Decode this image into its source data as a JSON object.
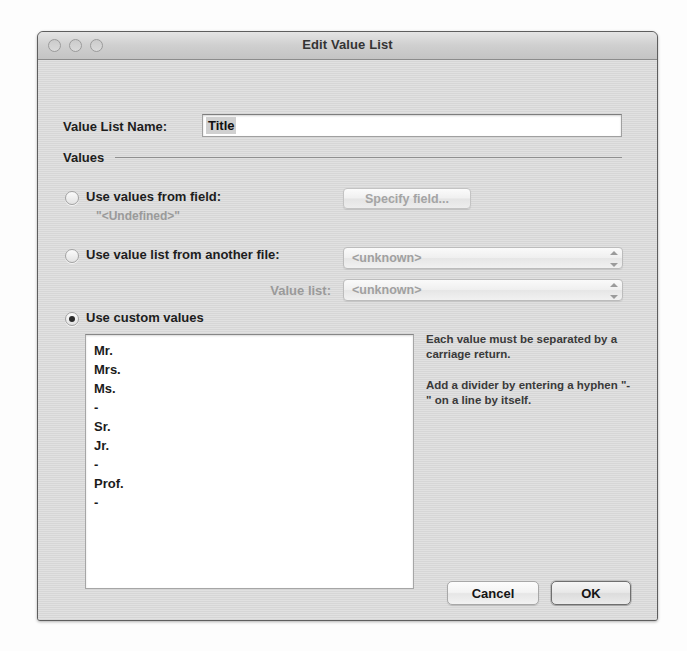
{
  "window": {
    "title": "Edit Value List",
    "traffic_lights": [
      "close-button",
      "minimize-button",
      "zoom-button"
    ]
  },
  "form": {
    "name_label": "Value List Name:",
    "name_value": "Title",
    "name_placeholder": "",
    "group_label": "Values"
  },
  "options": {
    "use_field": {
      "label": "Use values from field:",
      "selected": false,
      "note": "\"<Undefined>\"",
      "button_label": "Specify field..."
    },
    "use_other_file": {
      "label": "Use value list from another file:",
      "selected": false,
      "file_popup_value": "<unknown>",
      "valuelist_label": "Value list:",
      "valuelist_popup_value": "<unknown>"
    },
    "use_custom": {
      "label": "Use custom values",
      "selected": true,
      "values": [
        "Mr.",
        "Mrs.",
        "Ms.",
        "-",
        "Sr.",
        "Jr.",
        "-",
        "Prof.",
        "-"
      ]
    }
  },
  "help": {
    "paragraph_1": "Each value must be separated by a carriage return.",
    "paragraph_2": "Add a divider by entering a hyphen \"-\" on a line by itself."
  },
  "footer": {
    "cancel_label": "Cancel",
    "ok_label": "OK"
  },
  "colors": {
    "window_background": "#d9d9d9",
    "titlebar": "#cfcfcf",
    "field_background": "#ffffff",
    "text": "#1d1d1d",
    "disabled_text": "#9a9a9a",
    "border": "#5e5e5e"
  }
}
